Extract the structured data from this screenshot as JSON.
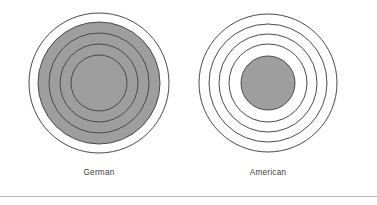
{
  "figure": {
    "background_color": "#ffffff",
    "stroke_color": "#4a4a4a",
    "fill_color": "#9e9e9e",
    "empty_color": "#ffffff",
    "rule_color": "#b4b4b4",
    "label_color": "#3c3c3c"
  },
  "panels": [
    {
      "id": "german",
      "label": "German",
      "center": {
        "cx": 90,
        "cy": 83
      },
      "rings": [
        {
          "index": 1,
          "r": 70,
          "filled": false
        },
        {
          "index": 2,
          "r": 61,
          "filled": true
        },
        {
          "index": 3,
          "r": 50,
          "filled": true
        },
        {
          "index": 4,
          "r": 39,
          "filled": true
        },
        {
          "index": 5,
          "r": 28,
          "filled": true
        }
      ],
      "filled_ring_count": 4,
      "total_ring_count": 5
    },
    {
      "id": "american",
      "label": "American",
      "center": {
        "cx": 90,
        "cy": 83
      },
      "rings": [
        {
          "index": 1,
          "r": 69,
          "filled": false
        },
        {
          "index": 2,
          "r": 59,
          "filled": false
        },
        {
          "index": 3,
          "r": 49,
          "filled": false
        },
        {
          "index": 4,
          "r": 39,
          "filled": false
        },
        {
          "index": 5,
          "r": 27,
          "filled": true
        }
      ],
      "filled_ring_count": 1,
      "total_ring_count": 5
    }
  ],
  "chart_data": {
    "type": "diagram",
    "title": "",
    "subtitle": "",
    "xlabel": "",
    "ylabel": "",
    "legend": [],
    "grid": false,
    "categories": [
      "German",
      "American"
    ],
    "series": [
      {
        "name": "rings total",
        "values": [
          5,
          5
        ]
      },
      {
        "name": "rings shaded",
        "values": [
          4,
          1
        ]
      }
    ],
    "radii": {
      "German": [
        70,
        61,
        50,
        39,
        28
      ],
      "American": [
        69,
        59,
        49,
        39,
        27
      ]
    },
    "shaded": {
      "German": [
        false,
        true,
        true,
        true,
        true
      ],
      "American": [
        false,
        false,
        false,
        false,
        true
      ]
    }
  }
}
